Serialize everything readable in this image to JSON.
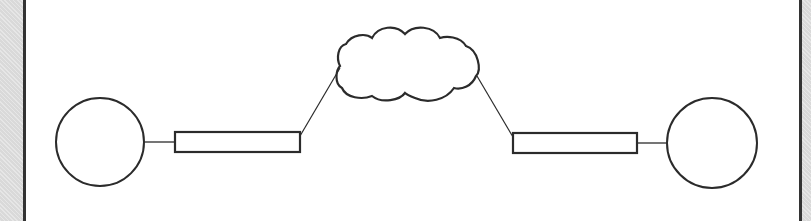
{
  "diagram": {
    "type": "network-topology",
    "stroke_color": "#2b2b2b",
    "background": "#ffffff",
    "border_color": "#333333",
    "margin_fill": "#d9d9d9",
    "nodes": [
      {
        "id": "left-endpoint",
        "shape": "circle",
        "cx": 100,
        "cy": 142,
        "r": 44
      },
      {
        "id": "left-link-device",
        "shape": "rectangle",
        "x": 175,
        "y": 132,
        "w": 125,
        "h": 20
      },
      {
        "id": "network-cloud",
        "shape": "cloud",
        "cx": 405,
        "cy": 63
      },
      {
        "id": "right-link-device",
        "shape": "rectangle",
        "x": 513,
        "y": 133,
        "w": 124,
        "h": 20
      },
      {
        "id": "right-endpoint",
        "shape": "circle",
        "cx": 712,
        "cy": 143,
        "r": 45
      }
    ],
    "edges": [
      {
        "from": "left-endpoint",
        "to": "left-link-device"
      },
      {
        "from": "left-link-device",
        "to": "network-cloud"
      },
      {
        "from": "network-cloud",
        "to": "right-link-device"
      },
      {
        "from": "right-link-device",
        "to": "right-endpoint"
      }
    ]
  }
}
